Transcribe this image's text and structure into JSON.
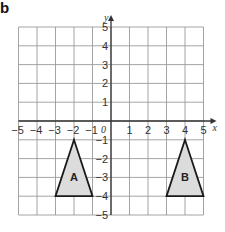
{
  "figure_label": "b",
  "axes": {
    "x_label": "x",
    "y_label": "y",
    "origin_label": "0",
    "x_ticks": [
      -5,
      -4,
      -3,
      -2,
      -1,
      1,
      2,
      3,
      4,
      5
    ],
    "y_ticks": [
      5,
      4,
      3,
      2,
      1,
      -1,
      -2,
      -3,
      -4,
      -5
    ],
    "x_range": [
      -5,
      5
    ],
    "y_range": [
      -5,
      5
    ],
    "grid": true
  },
  "shapes": [
    {
      "label": "A",
      "vertices": [
        [
          -2,
          -1
        ],
        [
          -3,
          -4
        ],
        [
          -1,
          -4
        ]
      ],
      "fill": "#dcdcdc",
      "stroke": "#1a1a1a"
    },
    {
      "label": "B",
      "vertices": [
        [
          4,
          -1
        ],
        [
          3,
          -4
        ],
        [
          5,
          -4
        ]
      ],
      "fill": "#dcdcdc",
      "stroke": "#1a1a1a"
    }
  ],
  "colors": {
    "grid": "#9a9a9a",
    "axis": "#333333"
  }
}
